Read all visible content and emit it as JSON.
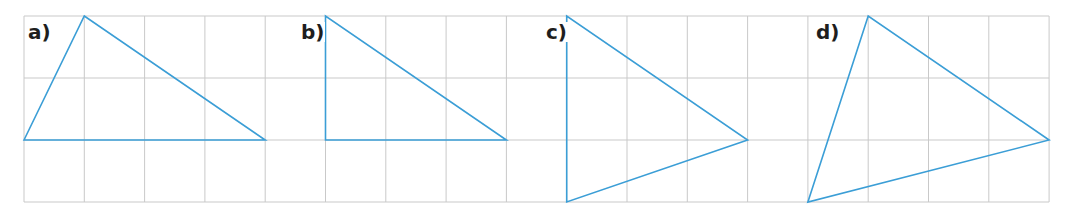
{
  "grid": {
    "origin_x": 24,
    "origin_y": 16,
    "cell_w": 60.3,
    "cell_h": 62,
    "cols": 17,
    "rows": 3,
    "line_color": "#c9c9c9"
  },
  "triangle_color": "#3b9ed6",
  "triangles": [
    {
      "label": "a)",
      "label_x": 27,
      "label_y": 22,
      "vertices": [
        [
          0,
          2
        ],
        [
          1,
          0
        ],
        [
          4,
          2
        ]
      ]
    },
    {
      "label": "b)",
      "label_x": 300,
      "label_y": 22,
      "vertices": [
        [
          5,
          0
        ],
        [
          5,
          2
        ],
        [
          8,
          2
        ]
      ]
    },
    {
      "label": "c)",
      "label_x": 545,
      "label_y": 22,
      "vertices": [
        [
          9,
          0
        ],
        [
          9,
          3
        ],
        [
          12,
          2
        ]
      ]
    },
    {
      "label": "d)",
      "label_x": 815,
      "label_y": 22,
      "vertices": [
        [
          13,
          3
        ],
        [
          14,
          0
        ],
        [
          17,
          2
        ]
      ]
    }
  ]
}
